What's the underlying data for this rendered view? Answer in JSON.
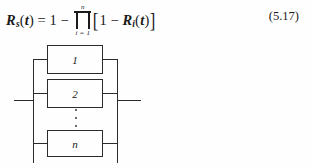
{
  "equation": {
    "lhs_symbol": "R",
    "lhs_subscript": "s",
    "lhs_arg_open": "(",
    "lhs_arg": "t",
    "lhs_arg_close": ")",
    "equals": "=",
    "one": "1",
    "minus": "−",
    "product_upper_limit": "n",
    "product_lower_limit": "i = 1",
    "bracket_open": "[",
    "inner_one": "1",
    "inner_minus": "−",
    "inner_symbol": "R",
    "inner_subscript": "i",
    "inner_arg_open": "(",
    "inner_arg": "t",
    "inner_arg_close": ")",
    "bracket_close": "]",
    "number": "(5.17)",
    "plain_text": "R_s(t) = 1 − ∏(i=1..n) [1 − R_i(t)]"
  },
  "diagram": {
    "type": "parallel-reliability-block-diagram",
    "blocks": [
      {
        "label": "1"
      },
      {
        "label": "2"
      },
      {
        "label": "n"
      }
    ],
    "ellipsis": "⋮"
  },
  "colors": {
    "ink": "#1a1a1a",
    "line": "#2b2b2b",
    "background": "#fefefe"
  }
}
